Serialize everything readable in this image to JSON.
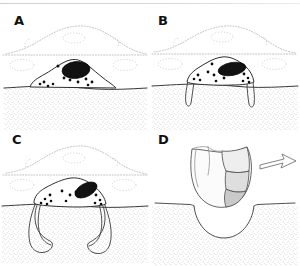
{
  "figure": {
    "kind": "scientific-line-drawing",
    "panel_count": 4,
    "background_color": "#ffffff",
    "ink_color": "#2e2e2e",
    "soft_ink_color": "#b4b4b9",
    "nucleus_color": "#121212"
  },
  "panels": [
    {
      "id": "A",
      "label": "A",
      "caption_text": "",
      "stage": "cell resting on flat substrate surface",
      "features": [
        "overlying dotted epithelial layer",
        "flat cell with single dark nucleus",
        "cytoplasmic granules",
        "flat substrate surface",
        "stippled substrate"
      ],
      "projection_count": 0,
      "substrate_surface": "flat"
    },
    {
      "id": "B",
      "label": "B",
      "caption_text": "",
      "stage": "cell with two short projections penetrating substrate",
      "features": [
        "overlying dotted epithelial layer",
        "cell with dark nucleus",
        "cytoplasmic granules",
        "two short downward projections",
        "stippled substrate"
      ],
      "projection_count": 2,
      "substrate_surface": "flat"
    },
    {
      "id": "C",
      "label": "C",
      "caption_text": "",
      "stage": "cell with long curved projections encircling a substrate fragment",
      "features": [
        "overlying dotted epithelial layer",
        "cell with dark nucleus",
        "cytoplasmic granules",
        "two long curved projections forming a basket",
        "enclosed substrate fragment",
        "stippled substrate"
      ],
      "projection_count": 2,
      "substrate_surface": "flat"
    },
    {
      "id": "D",
      "label": "D",
      "caption_text": "",
      "stage": "detached cup-shaped fragment removed, leaving resorption pit",
      "features": [
        "faceted cup-shaped fragment",
        "shaded facets",
        "outlined arrow indicating removal direction",
        "resorption pit in substrate",
        "stippled substrate"
      ],
      "arrow_direction": "right",
      "substrate_surface": "excavated pit"
    }
  ],
  "legend": {
    "nucleus_label": "nucleus",
    "granule_label": "granules",
    "substrate_label": "mineralized substrate",
    "epithelium_label": "overlying cell layer",
    "fragment_label": "detached fragment",
    "pit_label": "resorption pit"
  }
}
